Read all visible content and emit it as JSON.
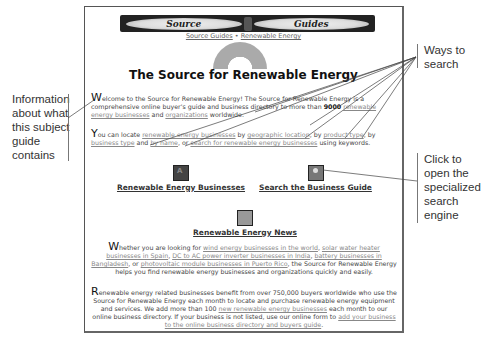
{
  "navbar": {
    "tab_left": "Source",
    "tab_right": "Guides"
  },
  "breadcrumb": {
    "item1": "Source Guides",
    "separator": " • ",
    "item2": "Renewable Energy"
  },
  "page_title": "The Source for Renewable Energy",
  "intro": {
    "cap": "W",
    "text1": "elcome to the Source for Renewable Energy! The Source for Renewable Energy is a comprehensive online buyer's guide and business directory to more than ",
    "count": "9000",
    "link1": "renewable energy businesses",
    "text2": " and ",
    "link2": "organizations",
    "text3": " worldwide."
  },
  "ways": {
    "cap": "Y",
    "text1": "ou can locate ",
    "link1": "renewable energy businesses",
    "text2": " by ",
    "link2": "geographic location",
    "text3": ", by ",
    "link3": "product type",
    "text4": ", by ",
    "link4": "business type",
    "text5": " and ",
    "link5": "by name",
    "text6": ", or ",
    "link6": "search for renewable energy businesses",
    "text7": " using keywords."
  },
  "icon_links": {
    "businesses": "Renewable Energy Businesses",
    "search": "Search the Business Guide",
    "news": "Renewable Energy News"
  },
  "whether": {
    "cap": "W",
    "text1": "hether you are looking for ",
    "link1": "wind energy businesses in the world",
    "text2": ", ",
    "link2": "solar water heater businesses in Spain",
    "text3": ", ",
    "link3": "DC to AC power inverter businesses in India",
    "text4": ", ",
    "link4": "battery businesses in Bangladesh",
    "text5": ", or ",
    "link5": "photovoltaic module businesses in Puerto Rico",
    "text6": ", the Source for Renewable Energy helps you find renewable energy businesses and organizations quickly and easily."
  },
  "benefit": {
    "cap": "R",
    "text1": "enewable energy related businesses benefit from over 750,000 buyers worldwide who use the Source for Renewable Energy each month to locate and purchase renewable energy equipment and services. We add more than 100 ",
    "link1": "new renewable energy businesses",
    "text2": " each month to our online business directory. If your business is not listed, use our online form to ",
    "link2": "add your business to the online business directory and buyers guide",
    "text3": "."
  },
  "callouts": {
    "left": [
      "Information",
      "about what",
      "this subject",
      "guide",
      "contains"
    ],
    "top_right": [
      "Ways to",
      "search"
    ],
    "bottom_right": [
      "Click to",
      "open the",
      "specialized",
      "search",
      "engine"
    ]
  }
}
